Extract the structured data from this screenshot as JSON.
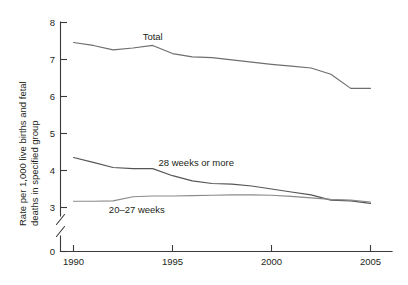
{
  "chart_data": {
    "type": "line",
    "title": "",
    "subtitle": "",
    "xlabel": "",
    "ylabel": "Rate per 1,000 live births and fetal deaths in specified group",
    "ylabel_line1": "Rate per 1,000 live births and fetal",
    "ylabel_line2": "deaths in specified group",
    "x": [
      1990,
      1991,
      1992,
      1993,
      1994,
      1995,
      1996,
      1997,
      1998,
      1999,
      2000,
      2001,
      2002,
      2003,
      2004,
      2005
    ],
    "xlim": [
      1989.3,
      2005.6
    ],
    "ylim": [
      3,
      8
    ],
    "y_axis_break": true,
    "y_break_between": [
      0,
      3
    ],
    "yticks": [
      0,
      3,
      4,
      5,
      6,
      7,
      8
    ],
    "ytick_labels": [
      "0",
      "3",
      "4",
      "5",
      "6",
      "7",
      "8"
    ],
    "xticks": [
      1990,
      1995,
      2000,
      2005
    ],
    "xtick_labels": [
      "1990",
      "1995",
      "2000",
      "2005"
    ],
    "grid": false,
    "legend_position": "inline-annotations",
    "series": [
      {
        "name": "Total",
        "label": "Total",
        "label_x": 1994.0,
        "label_y": 7.52,
        "color": "#6e6e6e",
        "values": [
          7.46,
          7.38,
          7.26,
          7.31,
          7.38,
          7.16,
          7.07,
          7.05,
          6.99,
          6.93,
          6.87,
          6.82,
          6.77,
          6.6,
          6.22,
          6.22
        ]
      },
      {
        "name": "28 weeks or more",
        "label": "28 weeks or more",
        "label_x": 1996.2,
        "label_y": 4.12,
        "color": "#555555",
        "values": [
          4.35,
          4.22,
          4.08,
          4.05,
          4.05,
          3.86,
          3.72,
          3.65,
          3.63,
          3.58,
          3.5,
          3.42,
          3.34,
          3.2,
          3.18,
          3.11
        ]
      },
      {
        "name": "20–27 weeks",
        "label": "20–27 weeks",
        "label_x": 1993.2,
        "label_y": 2.86,
        "color": "#8a8a8a",
        "values": [
          3.17,
          3.17,
          3.18,
          3.29,
          3.31,
          3.31,
          3.32,
          3.33,
          3.34,
          3.34,
          3.33,
          3.3,
          3.26,
          3.22,
          3.2,
          3.15
        ]
      }
    ],
    "colors": {
      "axis": "#3a3a3a",
      "text": "#231f20",
      "total_line": "#6e6e6e",
      "line_28weeks": "#555555",
      "line_2027weeks": "#8a8a8a",
      "background": "#ffffff"
    }
  }
}
